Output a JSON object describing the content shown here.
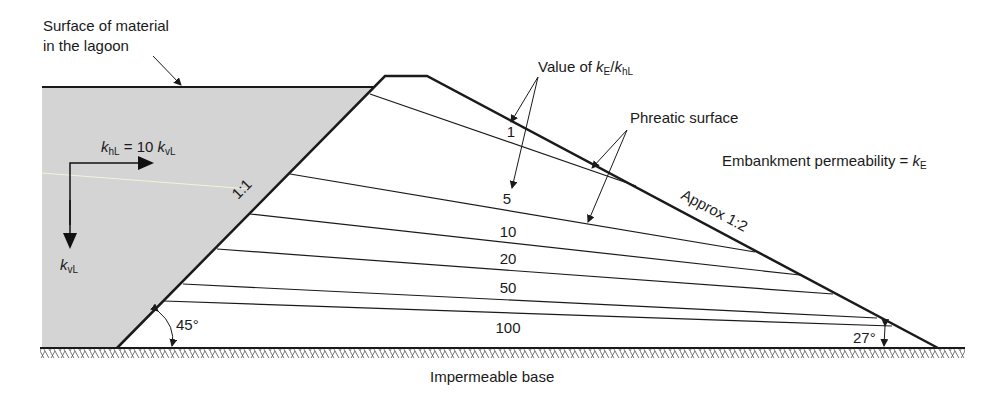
{
  "labels": {
    "surface": [
      "Surface of material",
      "in the lagoon"
    ],
    "khl_eq_prefix": "k",
    "khl_sub": "hL",
    "khl_eq_mid": " = 10 ",
    "kvl_sub": "vL",
    "kvl_label_k": "k",
    "kvl_label_sub": "vL",
    "value_of_prefix": "Value of ",
    "value_of_k1": "k",
    "value_of_sub1": "E",
    "value_of_slash": "/",
    "value_of_k2": "k",
    "value_of_sub2": "hL",
    "phreatic_surface": "Phreatic surface",
    "embankment_perm_prefix": "Embankment permeability = ",
    "embankment_perm_k": "k",
    "embankment_perm_sub": "E",
    "approx_slope": "Approx 1:2",
    "upstream_slope": "1:1",
    "angle_upstream": "45°",
    "angle_downstream": "27°",
    "impermeable_base": "Impermeable base"
  },
  "phreatic_lines": [
    {
      "ratio": "1",
      "x1": 370,
      "y1": 94,
      "x2": 636,
      "y2": 186,
      "label_x": 511,
      "label_y": 137
    },
    {
      "ratio": "5",
      "x1": 290,
      "y1": 174,
      "x2": 755,
      "y2": 252,
      "label_x": 512,
      "label_y": 205
    },
    {
      "ratio": "10",
      "x1": 250,
      "y1": 214,
      "x2": 800,
      "y2": 275,
      "label_x": 508,
      "label_y": 237
    },
    {
      "ratio": "20",
      "x1": 217,
      "y1": 249,
      "x2": 833,
      "y2": 294,
      "label_x": 508,
      "label_y": 263
    },
    {
      "ratio": "50",
      "x1": 183,
      "y1": 284,
      "x2": 877,
      "y2": 318,
      "label_x": 508,
      "label_y": 293
    },
    {
      "ratio": "100",
      "x1": 164,
      "y1": 301,
      "x2": 892,
      "y2": 326,
      "label_x": 508,
      "label_y": 333
    }
  ],
  "colors": {
    "lagoon_fill": "#d4d4d4",
    "line": "#1a1a1a",
    "hatch": "#555555"
  }
}
